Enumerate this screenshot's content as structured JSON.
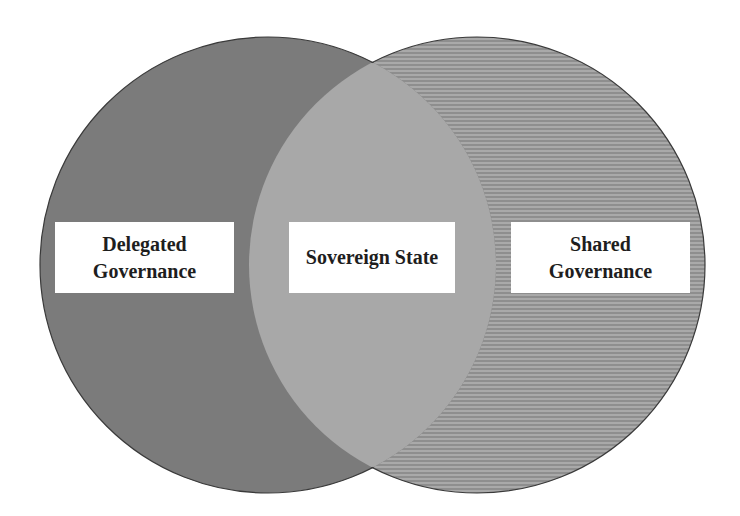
{
  "diagram": {
    "type": "venn",
    "sets": [
      {
        "id": "left",
        "label_lines": [
          "Delegated",
          "Governance"
        ],
        "fill": "#7b7b7b",
        "pattern": "solid"
      },
      {
        "id": "right",
        "label_lines": [
          "Shared",
          "Governance"
        ],
        "fill": "#a9a9a9",
        "stripe_color": "#8e8e8e",
        "pattern": "horizontal-stripes"
      }
    ],
    "intersection": {
      "label_lines": [
        "Sovereign State"
      ],
      "fill": "#a8a8a8"
    },
    "outline_color": "#3a3a3a"
  }
}
